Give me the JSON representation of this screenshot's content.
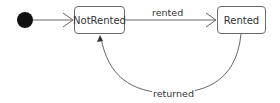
{
  "diagram": {
    "type": "state-machine",
    "states": [
      {
        "id": "initial",
        "label": "",
        "kind": "initial"
      },
      {
        "id": "not_rented",
        "label": "NotRented"
      },
      {
        "id": "rented",
        "label": "Rented"
      }
    ],
    "transitions": [
      {
        "from": "initial",
        "to": "not_rented",
        "label": ""
      },
      {
        "from": "not_rented",
        "to": "rented",
        "label": "rented"
      },
      {
        "from": "rented",
        "to": "not_rented",
        "label": "returned"
      }
    ]
  }
}
